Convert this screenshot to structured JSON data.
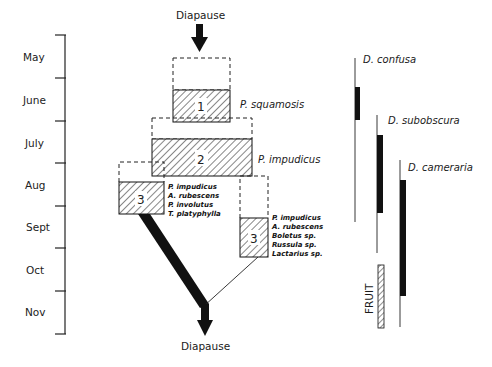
{
  "diagram": {
    "type": "phenology-diagram",
    "time_axis": {
      "months": [
        "May",
        "June",
        "July",
        "Aug",
        "Sept",
        "Oct",
        "Nov"
      ]
    },
    "diapause_top_label": "Diapause",
    "diapause_bottom_label": "Diapause",
    "generations": [
      {
        "number": "1",
        "hosts": [
          "P. squamosis"
        ]
      },
      {
        "number": "2",
        "hosts": [
          "P. impudicus"
        ]
      },
      {
        "number": "3",
        "branch": "left",
        "hosts": [
          "P. impudicus",
          "A. rubescens",
          "P. involutus",
          "T. platyphylla"
        ]
      },
      {
        "number": "3",
        "branch": "right",
        "hosts": [
          "P. impudicus",
          "A. rubescens",
          "Boletus sp.",
          "Russula sp.",
          "Lactarius sp."
        ]
      }
    ],
    "species": [
      {
        "name": "D. confusa"
      },
      {
        "name": "D. subobscura"
      },
      {
        "name": "D. cameraria"
      }
    ],
    "fruit_label": "FRUIT"
  }
}
